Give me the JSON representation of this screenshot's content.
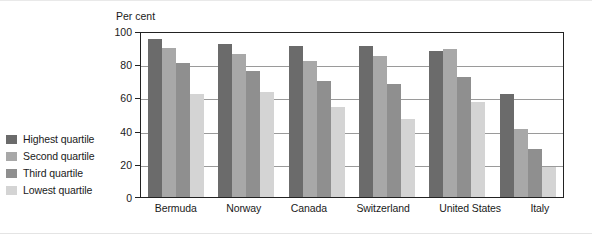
{
  "chart_data": {
    "type": "bar",
    "title": "",
    "subtitle": "",
    "xlabel": "",
    "ylabel": "Per cent",
    "ylim": [
      0,
      100
    ],
    "ytick_values": [
      0,
      20,
      40,
      60,
      80,
      100
    ],
    "ytick_labels": [
      "0",
      "20",
      "40",
      "60",
      "80",
      "100"
    ],
    "grid": true,
    "legend_position": "left",
    "categories": [
      "Bermuda",
      "Norway",
      "Canada",
      "Switzerland",
      "United States",
      "Italy"
    ],
    "series": [
      {
        "name": "Highest quartile",
        "color": "#6b6b6b",
        "values": [
          95,
          92,
          91,
          91,
          88,
          62
        ]
      },
      {
        "name": "Second quartile",
        "color": "#a8a8a8",
        "values": [
          90,
          86,
          82,
          85,
          89,
          41
        ]
      },
      {
        "name": "Third quartile",
        "color": "#8f8f8f",
        "values": [
          81,
          76,
          70,
          68,
          72,
          29
        ]
      },
      {
        "name": "Lowest quartile",
        "color": "#d4d4d4",
        "values": [
          62,
          63,
          54,
          47,
          57,
          18
        ]
      }
    ]
  },
  "colors": {
    "axis": "#222222",
    "grid": "#9a9a9a",
    "text": "#1a1a1a",
    "background": "#ffffff"
  }
}
